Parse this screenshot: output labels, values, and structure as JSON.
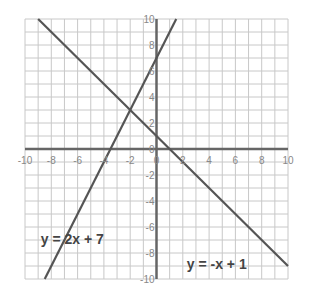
{
  "chart_data": {
    "type": "line",
    "title": "",
    "xlabel": "",
    "ylabel": "",
    "xlim": [
      -10,
      10
    ],
    "ylim": [
      -10,
      10
    ],
    "grid": true,
    "x_ticks": [
      "-10",
      "-8",
      "-6",
      "-4",
      "-2",
      "0",
      "2",
      "4",
      "6",
      "8",
      "10"
    ],
    "y_ticks": [
      "10",
      "8",
      "6",
      "4",
      "2",
      "0",
      "-2",
      "-4",
      "-6",
      "-8",
      "-10"
    ],
    "series": [
      {
        "name": "y = 2x + 7",
        "slope": 2,
        "intercept": 7,
        "x": [
          -8.5,
          1.5
        ],
        "y": [
          -10,
          10
        ]
      },
      {
        "name": "y = -x + 1",
        "slope": -1,
        "intercept": 1,
        "x": [
          -9,
          10
        ],
        "y": [
          10,
          -9
        ]
      }
    ],
    "annotations": [
      {
        "text": "y = 2x + 7",
        "x": -8.8,
        "y": -7.3
      },
      {
        "text": "y = -x + 1",
        "x": 2.3,
        "y": -9.2
      }
    ],
    "intersection": {
      "x": -2,
      "y": 3
    }
  }
}
